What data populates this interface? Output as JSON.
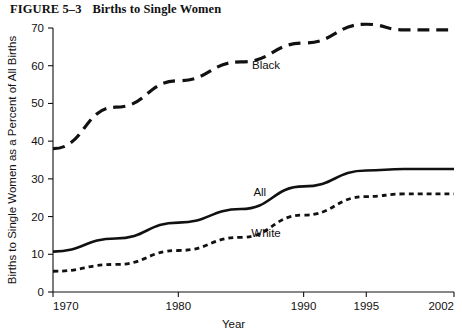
{
  "figure": {
    "number": "FIGURE 5–3",
    "title": "Births to Single Women"
  },
  "chart_data": {
    "type": "line",
    "title": "Births to Single Women",
    "xlabel": "Year",
    "ylabel": "Births to Single Women as a Percent of All Births",
    "xlim": [
      1970,
      2002
    ],
    "ylim": [
      0,
      70
    ],
    "xticks": [
      1970,
      1980,
      1990,
      1995,
      2002
    ],
    "xtick_labels": [
      "1970",
      "1980",
      "1990",
      "1995",
      "2002"
    ],
    "yticks": [
      0,
      10,
      20,
      30,
      40,
      50,
      60,
      70
    ],
    "ytick_labels": [
      "0",
      "10",
      "20",
      "30",
      "40",
      "50",
      "60",
      "70"
    ],
    "grid": false,
    "legend": "inline-labels",
    "x": [
      1970,
      1975,
      1980,
      1985,
      1990,
      1995,
      1998,
      2002
    ],
    "series": [
      {
        "name": "Black",
        "label": "Black",
        "style": "long-dashed",
        "color": "#111111",
        "values": [
          38,
          49,
          56,
          61,
          66,
          71,
          69.5,
          69.5
        ],
        "label_x": 1987,
        "label_y": 59
      },
      {
        "name": "All",
        "label": "All",
        "style": "solid",
        "color": "#111111",
        "values": [
          10.7,
          14.2,
          18.4,
          22,
          28,
          32.2,
          32.6,
          32.6
        ],
        "label_x": 1986.5,
        "label_y": 25.5
      },
      {
        "name": "White",
        "label": "White",
        "style": "short-dashed",
        "color": "#111111",
        "values": [
          5.5,
          7.3,
          11,
          14.5,
          20.4,
          25.3,
          26,
          26
        ],
        "label_x": 1987,
        "label_y": 14.5
      }
    ]
  }
}
